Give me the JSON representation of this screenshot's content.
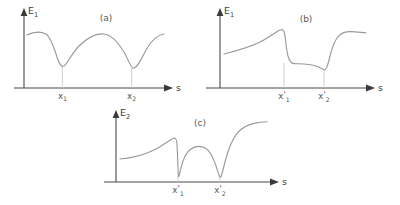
{
  "figure": {
    "background_color": "#ffffff",
    "axis_color": "#4a4a4a",
    "curve_color": "#9a9a9a",
    "dropline_color": "#cccccc",
    "text_color": "#3c3c3c"
  },
  "chart_data": [
    {
      "type": "line",
      "panel_tag": "(a)",
      "title": "(a)",
      "ylabel": "E",
      "ylabel_sub": "1",
      "xlabel": "s",
      "grid": false,
      "legend": "none",
      "xlim": [
        0,
        1
      ],
      "ylim": [
        0,
        1
      ],
      "tick_labels": [
        {
          "base": "x",
          "prime": "",
          "sub": "1",
          "x_frac": 0.32
        },
        {
          "base": "x",
          "prime": "",
          "sub": "2",
          "x_frac": 0.78
        }
      ],
      "description": "Smooth wavy potential curve with two broad minima located at x1 and x2 and a central maximum between them.",
      "x": [
        0.0,
        0.05,
        0.1,
        0.15,
        0.2,
        0.25,
        0.3,
        0.32,
        0.36,
        0.42,
        0.5,
        0.58,
        0.64,
        0.7,
        0.76,
        0.78,
        0.82,
        0.88,
        0.94,
        1.0
      ],
      "y": [
        0.63,
        0.65,
        0.65,
        0.62,
        0.52,
        0.38,
        0.28,
        0.27,
        0.3,
        0.42,
        0.56,
        0.58,
        0.53,
        0.42,
        0.28,
        0.24,
        0.28,
        0.48,
        0.62,
        0.66
      ]
    },
    {
      "type": "line",
      "panel_tag": "(b)",
      "title": "(b)",
      "ylabel": "E",
      "ylabel_sub": "1",
      "xlabel": "s",
      "grid": false,
      "legend": "none",
      "xlim": [
        0,
        1
      ],
      "ylim": [
        0,
        1
      ],
      "tick_labels": [
        {
          "base": "x",
          "prime": "'",
          "sub": "1",
          "x_frac": 0.44
        },
        {
          "base": "x",
          "prime": "'",
          "sub": "2",
          "x_frac": 0.72
        }
      ],
      "description": "Step-like adiabatic curve: slow rise to a local maximum just before x'1, a sharp drop to a low plateau, then a sharp rise just after x'2 to a high plateau.",
      "x": [
        0.0,
        0.08,
        0.16,
        0.24,
        0.32,
        0.38,
        0.42,
        0.44,
        0.46,
        0.49,
        0.54,
        0.6,
        0.66,
        0.7,
        0.72,
        0.74,
        0.77,
        0.82,
        0.9,
        1.0
      ],
      "y": [
        0.4,
        0.44,
        0.49,
        0.55,
        0.62,
        0.67,
        0.66,
        0.56,
        0.36,
        0.28,
        0.29,
        0.28,
        0.25,
        0.22,
        0.21,
        0.34,
        0.58,
        0.66,
        0.68,
        0.67
      ]
    },
    {
      "type": "line",
      "panel_tag": "(c)",
      "title": "(c)",
      "ylabel": "E",
      "ylabel_sub": "2",
      "xlabel": "s",
      "grid": false,
      "legend": "none",
      "xlim": [
        0,
        1
      ],
      "ylim": [
        0,
        1
      ],
      "tick_labels": [
        {
          "base": "x",
          "prime": "'",
          "sub": "1",
          "x_frac": 0.4
        },
        {
          "base": "x",
          "prime": "'",
          "sub": "2",
          "x_frac": 0.68
        }
      ],
      "description": "Diabatic coupling curve with two sharp narrow V-shaped cusps that dip almost to zero exactly at x'1 and x'2, a rounded hump between them, and a steep rise at the right edge.",
      "x": [
        0.0,
        0.08,
        0.16,
        0.24,
        0.31,
        0.36,
        0.38,
        0.4,
        0.42,
        0.45,
        0.5,
        0.55,
        0.6,
        0.64,
        0.66,
        0.68,
        0.7,
        0.74,
        0.8,
        0.88,
        1.0
      ],
      "y": [
        0.38,
        0.4,
        0.44,
        0.5,
        0.57,
        0.56,
        0.48,
        0.06,
        0.26,
        0.4,
        0.46,
        0.46,
        0.4,
        0.28,
        0.16,
        0.05,
        0.26,
        0.55,
        0.68,
        0.75,
        0.8
      ]
    }
  ]
}
